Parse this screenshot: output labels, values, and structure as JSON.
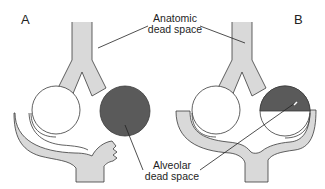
{
  "diagram": {
    "panels": [
      {
        "id": "A",
        "label": "A",
        "description": "Perfused and non-perfused alveolus (right alveolus receives no blood flow)"
      },
      {
        "id": "B",
        "label": "B",
        "description": "Partially perfused alveolus (right alveolus half filled)"
      }
    ],
    "labels": {
      "anatomic_line1": "Anatomic",
      "anatomic_line2": "dead space",
      "alveolar_line1": "Alveolar",
      "alveolar_line2": "dead space"
    },
    "colors": {
      "airway_fill": "#d9d9d9",
      "outline": "#3a3a3a",
      "dead_space_fill": "#5a5a5a",
      "alveolus_fill": "#ffffff",
      "background": "#ffffff"
    }
  }
}
